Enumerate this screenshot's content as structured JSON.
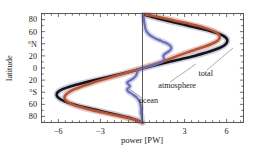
{
  "chart_data": {
    "type": "line",
    "title": "",
    "xlabel": "power [PW]",
    "ylabel": "latitude",
    "xlim": [
      -7.2,
      7.2
    ],
    "ylim": [
      -90,
      90
    ],
    "xticks": [
      -6,
      -3,
      0,
      3,
      6
    ],
    "xticklabels": [
      "−6",
      "−3",
      "",
      "3",
      "6"
    ],
    "yticks": [
      80,
      60,
      40,
      20,
      0,
      -20,
      -40,
      -60,
      -80
    ],
    "yticklabels": [
      "80",
      "60",
      "°N",
      "20",
      "0",
      "20",
      "°S",
      "60",
      "80"
    ],
    "grid": false,
    "legend_position": "annotations-inline",
    "zero_line": true,
    "series": [
      {
        "name": "total",
        "color": "#141414",
        "halo_color": "#b9bcdc",
        "width": 2.6,
        "points": [
          [
            -90,
            0.0
          ],
          [
            -85,
            -0.55
          ],
          [
            -80,
            -1.35
          ],
          [
            -75,
            -2.25
          ],
          [
            -70,
            -3.2
          ],
          [
            -65,
            -4.15
          ],
          [
            -60,
            -4.95
          ],
          [
            -55,
            -5.55
          ],
          [
            -50,
            -5.95
          ],
          [
            -45,
            -6.12
          ],
          [
            -40,
            -6.05
          ],
          [
            -35,
            -5.7
          ],
          [
            -30,
            -5.1
          ],
          [
            -25,
            -4.3
          ],
          [
            -20,
            -3.4
          ],
          [
            -15,
            -2.45
          ],
          [
            -10,
            -1.55
          ],
          [
            -5,
            -0.7
          ],
          [
            0,
            0.1
          ],
          [
            5,
            0.95
          ],
          [
            10,
            1.85
          ],
          [
            15,
            2.8
          ],
          [
            20,
            3.7
          ],
          [
            25,
            4.5
          ],
          [
            30,
            5.15
          ],
          [
            35,
            5.65
          ],
          [
            40,
            5.95
          ],
          [
            45,
            6.05
          ],
          [
            50,
            5.95
          ],
          [
            55,
            5.6
          ],
          [
            60,
            5.0
          ],
          [
            65,
            4.2
          ],
          [
            70,
            3.25
          ],
          [
            75,
            2.3
          ],
          [
            80,
            1.4
          ],
          [
            85,
            0.6
          ],
          [
            88,
            0.1
          ]
        ]
      },
      {
        "name": "atmosphere",
        "color": "#b3543a",
        "halo_color": "#e0b9aa",
        "width": 2.6,
        "points": [
          [
            -90,
            0.0
          ],
          [
            -85,
            -0.6
          ],
          [
            -80,
            -1.5
          ],
          [
            -75,
            -2.5
          ],
          [
            -70,
            -3.5
          ],
          [
            -65,
            -4.35
          ],
          [
            -60,
            -5.0
          ],
          [
            -55,
            -5.4
          ],
          [
            -50,
            -5.55
          ],
          [
            -45,
            -5.5
          ],
          [
            -40,
            -5.25
          ],
          [
            -35,
            -4.85
          ],
          [
            -30,
            -4.3
          ],
          [
            -25,
            -3.65
          ],
          [
            -20,
            -2.95
          ],
          [
            -15,
            -2.2
          ],
          [
            -10,
            -1.45
          ],
          [
            -5,
            -0.7
          ],
          [
            0,
            0.0
          ],
          [
            5,
            0.7
          ],
          [
            10,
            1.35
          ],
          [
            15,
            1.95
          ],
          [
            20,
            2.5
          ],
          [
            25,
            3.1
          ],
          [
            30,
            3.75
          ],
          [
            35,
            4.4
          ],
          [
            40,
            4.95
          ],
          [
            45,
            5.35
          ],
          [
            50,
            5.5
          ],
          [
            55,
            5.45
          ],
          [
            60,
            5.15
          ],
          [
            65,
            4.6
          ],
          [
            70,
            3.85
          ],
          [
            75,
            2.95
          ],
          [
            80,
            1.95
          ],
          [
            85,
            0.95
          ],
          [
            88,
            0.25
          ]
        ]
      },
      {
        "name": "ocean",
        "color": "#6a6fb5",
        "halo_color": "#c3c6e4",
        "width": 2.2,
        "points": [
          [
            -90,
            0.0
          ],
          [
            -87,
            -0.05
          ],
          [
            -84,
            -0.05
          ],
          [
            -80,
            -0.05
          ],
          [
            -76,
            -0.1
          ],
          [
            -72,
            -0.12
          ],
          [
            -68,
            -0.1
          ],
          [
            -64,
            -0.12
          ],
          [
            -60,
            -0.15
          ],
          [
            -56,
            -0.2
          ],
          [
            -52,
            -0.3
          ],
          [
            -48,
            -0.45
          ],
          [
            -45,
            -0.62
          ],
          [
            -42,
            -0.8
          ],
          [
            -40,
            -0.95
          ],
          [
            -38,
            -1.05
          ],
          [
            -36,
            -1.1
          ],
          [
            -34,
            -1.05
          ],
          [
            -32,
            -0.95
          ],
          [
            -30,
            -0.9
          ],
          [
            -28,
            -0.95
          ],
          [
            -26,
            -1.05
          ],
          [
            -24,
            -1.1
          ],
          [
            -22,
            -1.0
          ],
          [
            -20,
            -0.85
          ],
          [
            -18,
            -0.7
          ],
          [
            -15,
            -0.55
          ],
          [
            -12,
            -0.45
          ],
          [
            -9,
            -0.4
          ],
          [
            -6,
            -0.35
          ],
          [
            -3,
            -0.25
          ],
          [
            0,
            0.1
          ],
          [
            3,
            0.5
          ],
          [
            6,
            0.95
          ],
          [
            9,
            1.3
          ],
          [
            12,
            1.5
          ],
          [
            15,
            1.55
          ],
          [
            18,
            1.5
          ],
          [
            21,
            1.5
          ],
          [
            24,
            1.65
          ],
          [
            27,
            1.85
          ],
          [
            30,
            2.0
          ],
          [
            33,
            2.05
          ],
          [
            36,
            2.0
          ],
          [
            39,
            1.85
          ],
          [
            42,
            1.6
          ],
          [
            45,
            1.3
          ],
          [
            48,
            1.0
          ],
          [
            51,
            0.75
          ],
          [
            54,
            0.55
          ],
          [
            57,
            0.4
          ],
          [
            60,
            0.3
          ],
          [
            64,
            0.22
          ],
          [
            68,
            0.18
          ],
          [
            72,
            0.15
          ],
          [
            76,
            0.12
          ],
          [
            80,
            0.1
          ],
          [
            84,
            0.08
          ],
          [
            88,
            0.05
          ]
        ]
      }
    ],
    "annotations": [
      {
        "id": "total",
        "label": "total",
        "x": 213,
        "y": 76,
        "leader": [
          [
            207,
            70
          ],
          [
            233,
            48
          ]
        ]
      },
      {
        "id": "atmosphere",
        "label": "atmosphere",
        "x": 196,
        "y": 88,
        "leader": [
          [
            170,
            82
          ],
          [
            196,
            64
          ]
        ]
      },
      {
        "id": "ocean",
        "label": "ocean",
        "x": 158,
        "y": 103,
        "leader": [
          [
            142,
            98
          ],
          [
            128,
            88
          ]
        ]
      }
    ]
  }
}
